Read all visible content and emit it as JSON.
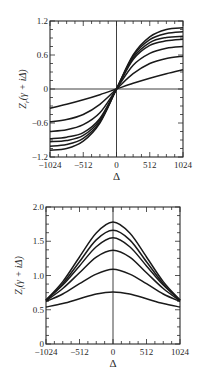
{
  "chart_data": [
    {
      "type": "line",
      "title": "",
      "xlabel": "Δ",
      "ylabel": "Z_r(γ + iΔ)",
      "xlim": [
        -1024,
        1024
      ],
      "ylim": [
        -1.2,
        1.2
      ],
      "xticks": [
        -1024,
        -512,
        0,
        512,
        1024
      ],
      "yticks": [
        -1.2,
        -0.6,
        0,
        0.6,
        1.2
      ],
      "xtick_labels": [
        "−1024",
        "−512",
        "0",
        "512",
        "1024"
      ],
      "ytick_labels": [
        "−1.2",
        "−0.6",
        "0",
        "0.6",
        "1.2"
      ],
      "grid": false,
      "legend": null,
      "x": [
        -1024,
        -768,
        -512,
        -256,
        0,
        256,
        512,
        768,
        1024
      ],
      "series": [
        {
          "name": "curve-1",
          "values": [
            -1.08,
            -1.05,
            -0.92,
            -0.6,
            0,
            0.6,
            0.92,
            1.05,
            1.08
          ]
        },
        {
          "name": "curve-2",
          "values": [
            -1.01,
            -0.98,
            -0.87,
            -0.58,
            0,
            0.58,
            0.87,
            0.98,
            1.01
          ]
        },
        {
          "name": "curve-3",
          "values": [
            -0.93,
            -0.91,
            -0.82,
            -0.55,
            0,
            0.55,
            0.82,
            0.91,
            0.93
          ]
        },
        {
          "name": "curve-4",
          "values": [
            -0.88,
            -0.85,
            -0.77,
            -0.52,
            0,
            0.52,
            0.77,
            0.85,
            0.88
          ]
        },
        {
          "name": "curve-5",
          "values": [
            -0.75,
            -0.72,
            -0.63,
            -0.42,
            0,
            0.42,
            0.63,
            0.72,
            0.75
          ]
        },
        {
          "name": "curve-6",
          "values": [
            -0.58,
            -0.54,
            -0.45,
            -0.27,
            0,
            0.27,
            0.45,
            0.54,
            0.58
          ]
        },
        {
          "name": "curve-7",
          "values": [
            -0.34,
            -0.27,
            -0.19,
            -0.1,
            0,
            0.1,
            0.19,
            0.27,
            0.34
          ]
        }
      ]
    },
    {
      "type": "line",
      "title": "",
      "xlabel": "Δ",
      "ylabel": "Z_i(γ + iΔ)",
      "xlim": [
        -1024,
        1024
      ],
      "ylim": [
        0,
        2.0
      ],
      "xticks": [
        -1024,
        -512,
        0,
        512,
        1024
      ],
      "yticks": [
        0,
        0.5,
        1.0,
        1.5,
        2.0
      ],
      "xtick_labels": [
        "−1024",
        "−512",
        "0",
        "512",
        "1024"
      ],
      "ytick_labels": [
        "0",
        "0.5",
        "1.0",
        "1.5",
        "2.0"
      ],
      "grid": false,
      "legend": null,
      "x": [
        -1024,
        -768,
        -512,
        -256,
        0,
        256,
        512,
        768,
        1024
      ],
      "series": [
        {
          "name": "curve-1",
          "values": [
            0.64,
            0.91,
            1.27,
            1.62,
            1.78,
            1.62,
            1.27,
            0.91,
            0.64
          ]
        },
        {
          "name": "curve-2",
          "values": [
            0.64,
            0.88,
            1.2,
            1.52,
            1.66,
            1.52,
            1.2,
            0.88,
            0.64
          ]
        },
        {
          "name": "curve-3",
          "values": [
            0.64,
            0.86,
            1.14,
            1.42,
            1.55,
            1.42,
            1.14,
            0.86,
            0.64
          ]
        },
        {
          "name": "curve-4",
          "values": [
            0.63,
            0.81,
            1.04,
            1.27,
            1.37,
            1.27,
            1.04,
            0.81,
            0.63
          ]
        },
        {
          "name": "curve-5",
          "values": [
            0.62,
            0.73,
            0.88,
            1.02,
            1.09,
            1.02,
            0.88,
            0.73,
            0.62
          ]
        },
        {
          "name": "curve-6",
          "values": [
            0.54,
            0.59,
            0.66,
            0.73,
            0.76,
            0.73,
            0.66,
            0.59,
            0.54
          ]
        }
      ]
    }
  ],
  "style": {
    "line_color": "#1a1a1a",
    "axis_color": "#2a2a2a",
    "background": "#ffffff"
  }
}
